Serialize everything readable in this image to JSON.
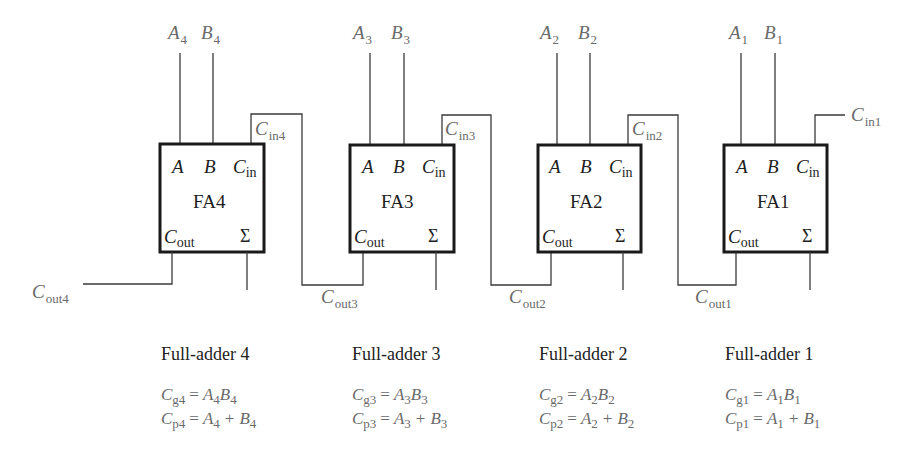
{
  "diagram": {
    "adders": [
      {
        "id": "FA4",
        "label": "FA4",
        "input_a": {
          "base": "A",
          "sub": "4"
        },
        "input_b": {
          "base": "B",
          "sub": "4"
        },
        "carry_in": {
          "base": "C",
          "sub": "in4"
        },
        "carry_out": {
          "base": "C",
          "sub": "out4"
        },
        "pins": {
          "a": "A",
          "b": "B",
          "cin": "C",
          "cin_sub": "in",
          "cout": "C",
          "cout_sub": "out",
          "sum": "Σ"
        },
        "heading": "Full-adder 4",
        "generate": {
          "lhs": "C",
          "lhs_sub": "g4",
          "rhs": [
            {
              "t": "A",
              "s": "4"
            },
            {
              "t": "B",
              "s": "4"
            }
          ],
          "op": ""
        },
        "propagate": {
          "lhs": "C",
          "lhs_sub": "p4",
          "rhs": [
            {
              "t": "A",
              "s": "4"
            },
            {
              "t": "B",
              "s": "4"
            }
          ],
          "op": "+"
        }
      },
      {
        "id": "FA3",
        "label": "FA3",
        "input_a": {
          "base": "A",
          "sub": "3"
        },
        "input_b": {
          "base": "B",
          "sub": "3"
        },
        "carry_in": {
          "base": "C",
          "sub": "in3"
        },
        "carry_out": {
          "base": "C",
          "sub": "out3"
        },
        "pins": {
          "a": "A",
          "b": "B",
          "cin": "C",
          "cin_sub": "in",
          "cout": "C",
          "cout_sub": "out",
          "sum": "Σ"
        },
        "heading": "Full-adder 3",
        "generate": {
          "lhs": "C",
          "lhs_sub": "g3",
          "rhs": [
            {
              "t": "A",
              "s": "3"
            },
            {
              "t": "B",
              "s": "3"
            }
          ],
          "op": ""
        },
        "propagate": {
          "lhs": "C",
          "lhs_sub": "p3",
          "rhs": [
            {
              "t": "A",
              "s": "3"
            },
            {
              "t": "B",
              "s": "3"
            }
          ],
          "op": "+"
        }
      },
      {
        "id": "FA2",
        "label": "FA2",
        "input_a": {
          "base": "A",
          "sub": "2"
        },
        "input_b": {
          "base": "B",
          "sub": "2"
        },
        "carry_in": {
          "base": "C",
          "sub": "in2"
        },
        "carry_out": {
          "base": "C",
          "sub": "out2"
        },
        "pins": {
          "a": "A",
          "b": "B",
          "cin": "C",
          "cin_sub": "in",
          "cout": "C",
          "cout_sub": "out",
          "sum": "Σ"
        },
        "heading": "Full-adder 2",
        "generate": {
          "lhs": "C",
          "lhs_sub": "g2",
          "rhs": [
            {
              "t": "A",
              "s": "2"
            },
            {
              "t": "B",
              "s": "2"
            }
          ],
          "op": ""
        },
        "propagate": {
          "lhs": "C",
          "lhs_sub": "p2",
          "rhs": [
            {
              "t": "A",
              "s": "2"
            },
            {
              "t": "B",
              "s": "2"
            }
          ],
          "op": "+"
        }
      },
      {
        "id": "FA1",
        "label": "FA1",
        "input_a": {
          "base": "A",
          "sub": "1"
        },
        "input_b": {
          "base": "B",
          "sub": "1"
        },
        "carry_in": {
          "base": "C",
          "sub": "in1"
        },
        "carry_out": {
          "base": "C",
          "sub": "out1"
        },
        "pins": {
          "a": "A",
          "b": "B",
          "cin": "C",
          "cin_sub": "in",
          "cout": "C",
          "cout_sub": "out",
          "sum": "Σ"
        },
        "heading": "Full-adder 1",
        "generate": {
          "lhs": "C",
          "lhs_sub": "g1",
          "rhs": [
            {
              "t": "A",
              "s": "1"
            },
            {
              "t": "B",
              "s": "1"
            }
          ],
          "op": ""
        },
        "propagate": {
          "lhs": "C",
          "lhs_sub": "p1",
          "rhs": [
            {
              "t": "A",
              "s": "1"
            },
            {
              "t": "B",
              "s": "1"
            }
          ],
          "op": "+"
        }
      }
    ],
    "equals": "=",
    "colors": {
      "box_stroke": "#1a1a1a",
      "wire": "#3a3a3a",
      "label_gray": "#6a6a6a",
      "text_dark": "#1e1e1e"
    }
  }
}
